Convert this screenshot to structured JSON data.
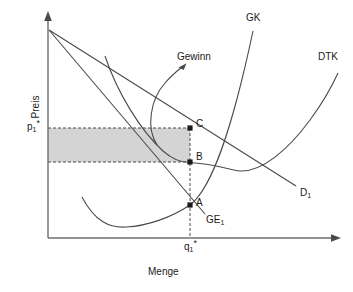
{
  "figure": {
    "type": "economics-diagram",
    "background_color": "#ffffff",
    "line_color": "#3f3f3f",
    "text_color": "#1a1a1a",
    "shade_color": "#d4d4d4"
  },
  "axes": {
    "y_title": "Preis",
    "x_title": "Menge",
    "y_tick_label": "p",
    "y_tick_sub": "1",
    "y_tick_star": "*",
    "x_tick_label": "q",
    "x_tick_sub": "1",
    "x_tick_star": "*"
  },
  "curves": [
    {
      "name": "GK",
      "label": "GK",
      "label_x": 246,
      "label_y": 13,
      "meaning": "marginal-cost-curve"
    },
    {
      "name": "DTK",
      "label": "DTK",
      "label_x": 318,
      "label_y": 52,
      "meaning": "average-total-cost-curve"
    },
    {
      "name": "D1",
      "label": "D",
      "label_sub": "1",
      "label_x": 300,
      "label_y": 188,
      "meaning": "demand-curve"
    },
    {
      "name": "GE1",
      "label": "GE",
      "label_sub": "1",
      "label_x": 206,
      "label_y": 215,
      "meaning": "marginal-revenue-curve"
    }
  ],
  "points": [
    {
      "name": "C",
      "label": "C",
      "label_x": 196,
      "label_y": 119,
      "x": 190,
      "y": 128
    },
    {
      "name": "B",
      "label": "B",
      "label_x": 196,
      "label_y": 152,
      "x": 190,
      "y": 162
    },
    {
      "name": "A",
      "label": "A",
      "label_x": 196,
      "label_y": 198,
      "x": 190,
      "y": 205
    }
  ],
  "annotations": [
    {
      "name": "Gewinn",
      "label": "Gewinn",
      "label_x": 177,
      "label_y": 52,
      "meaning": "profit-area-callout"
    }
  ],
  "shaded_region": {
    "meaning": "profit-rectangle",
    "x": 48,
    "y": 128,
    "width": 142,
    "height": 34,
    "fill": "#d4d4d4"
  }
}
